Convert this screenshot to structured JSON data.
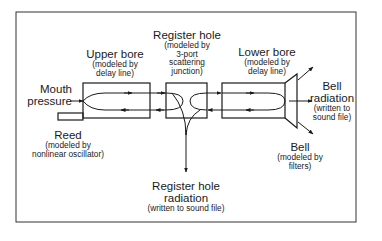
{
  "diagram": {
    "components": {
      "mouth": {
        "title": "Mouth",
        "title2": "pressure"
      },
      "upper_bore": {
        "title": "Upper bore",
        "note1": "(modeled by",
        "note2": "delay line)"
      },
      "register_hole": {
        "title": "Register hole",
        "note1": "(modeled by",
        "note2": "3-port",
        "note3": "scattering",
        "note4": "junction)"
      },
      "lower_bore": {
        "title": "Lower bore",
        "note1": "(modeled by",
        "note2": "delay line)"
      },
      "bell_radiation": {
        "title": "Bell",
        "title2": "radiation",
        "note1": "(written to",
        "note2": "sound file)"
      },
      "reed": {
        "title": "Reed",
        "note1": "(modeled by",
        "note2": "nonlinear oscillator)"
      },
      "bell": {
        "title": "Bell",
        "note1": "(modeled by",
        "note2": "filters)"
      },
      "register_radiation": {
        "title": "Register hole",
        "title2": "radiation",
        "note1": "(written to sound file)"
      }
    },
    "colors": {
      "line": "#1a1a1a",
      "background": "#ffffff",
      "frame": "#333333"
    }
  }
}
